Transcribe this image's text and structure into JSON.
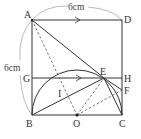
{
  "diagram": {
    "measurements": {
      "top": "6cm",
      "left": "6cm"
    },
    "points": {
      "A": {
        "label": "A",
        "x": 32,
        "y": 20
      },
      "D": {
        "label": "D",
        "x": 122,
        "y": 20
      },
      "B": {
        "label": "B",
        "x": 32,
        "y": 115
      },
      "C": {
        "label": "C",
        "x": 122,
        "y": 115
      },
      "G": {
        "label": "G",
        "x": 32,
        "y": 78
      },
      "H": {
        "label": "H",
        "x": 122,
        "y": 78
      },
      "E": {
        "label": "E",
        "x": 104,
        "y": 78
      },
      "F": {
        "label": "F",
        "x": 122,
        "y": 90
      },
      "O": {
        "label": "O",
        "x": 77,
        "y": 115
      },
      "I": {
        "label": "I",
        "x": 64,
        "y": 94
      }
    },
    "colors": {
      "line": "#333333",
      "dashed": "#555555",
      "arc": "#999999",
      "background": "#ffffff"
    }
  }
}
